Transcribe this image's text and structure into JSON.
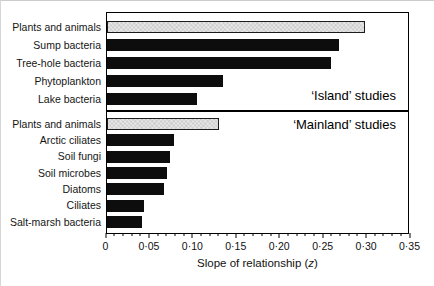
{
  "chart_data": {
    "type": "bar",
    "orientation": "horizontal",
    "title": "",
    "xlabel": "Slope of relationship (z)",
    "xlabel_prefix": "Slope of relationship (",
    "xlabel_var": "z",
    "xlabel_suffix": ")",
    "xlim": [
      0,
      0.35
    ],
    "x_major_tick_step": 0.05,
    "x_minor_tick_step": 0.01,
    "x_major_ticks": [
      0,
      0.05,
      0.1,
      0.15,
      0.2,
      0.25,
      0.3,
      0.35
    ],
    "x_tick_labels": [
      "0",
      "0·05",
      "0·10",
      "0·15",
      "0·20",
      "0·25",
      "0·30",
      "0·35"
    ],
    "grid": false,
    "legend": false,
    "groups": [
      {
        "title": "‘Island’ studies",
        "bars": [
          {
            "label": "Plants and animals",
            "value": 0.3,
            "style": "gray"
          },
          {
            "label": "Sump bacteria",
            "value": 0.27,
            "style": "black"
          },
          {
            "label": "Tree-hole bacteria",
            "value": 0.26,
            "style": "black"
          },
          {
            "label": "Phytoplankton",
            "value": 0.135,
            "style": "black"
          },
          {
            "label": "Lake bacteria",
            "value": 0.105,
            "style": "black"
          }
        ]
      },
      {
        "title": "‘Mainland’ studies",
        "bars": [
          {
            "label": "Plants and animals",
            "value": 0.13,
            "style": "gray"
          },
          {
            "label": "Arctic ciliates",
            "value": 0.078,
            "style": "black"
          },
          {
            "label": "Soil fungi",
            "value": 0.073,
            "style": "black"
          },
          {
            "label": "Soil microbes",
            "value": 0.07,
            "style": "black"
          },
          {
            "label": "Diatoms",
            "value": 0.066,
            "style": "black"
          },
          {
            "label": "Ciliates",
            "value": 0.043,
            "style": "black"
          },
          {
            "label": "Salt-marsh bacteria",
            "value": 0.041,
            "style": "black"
          }
        ]
      }
    ],
    "colors": {
      "black_bar": "#0d0d0d",
      "gray_bar_fill": "#e7e7e7",
      "gray_bar_border": "#1c1c1c",
      "frame": "#000000",
      "background": "#ffffff"
    }
  }
}
